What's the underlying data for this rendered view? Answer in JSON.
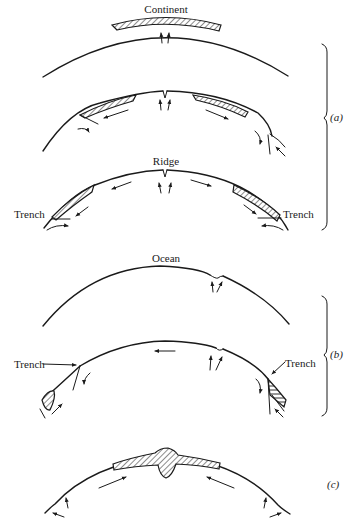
{
  "figure": {
    "type": "plate-tectonics-schematic",
    "background": "#ffffff",
    "ink": "#1a1a1a"
  },
  "labels": {
    "continent": "Continent",
    "ridge": "Ridge",
    "trench_left_a": "Trench",
    "trench_right_a": "Trench",
    "ocean": "Ocean",
    "trench_left_b": "Trench",
    "trench_right_b": "Trench"
  },
  "panels": [
    {
      "id": "a",
      "label": "(a)",
      "stages": 3,
      "description": "Continent rifting at ridge, pieces drift apart toward trenches"
    },
    {
      "id": "b",
      "label": "(b)",
      "stages": 2,
      "description": "Ocean with ridge; plates subduct at trenches"
    },
    {
      "id": "c",
      "label": "(c)",
      "stages": 1,
      "description": "Continents collide forming mountain root"
    }
  ]
}
